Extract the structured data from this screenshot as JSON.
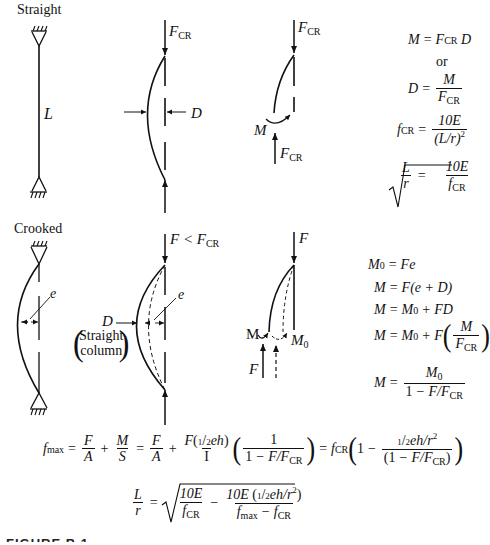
{
  "sections": {
    "straight": {
      "title": "Straight",
      "column_length_label": "L",
      "bent_column": {
        "force_top": "F",
        "force_top_sub": "CR",
        "deflection_label": "D"
      },
      "free_body": {
        "force_top": "F",
        "force_top_sub": "CR",
        "moment_label": "M",
        "force_bottom": "F",
        "force_bottom_sub": "CR"
      },
      "equations": [
        "M = F_CR D",
        "or",
        "D = M / F_CR",
        "f_CR = 10E / (L/r)^2",
        "L/r = sqrt(10E / f_CR)"
      ]
    },
    "crooked": {
      "title": "Crooked",
      "eccentricity_label": "e",
      "bent_column": {
        "force_top": "F < F",
        "force_top_sub": "CR",
        "deflection_label": "D",
        "eccentricity_label": "e",
        "note_line1": "Straight",
        "note_line2": "column"
      },
      "free_body": {
        "force_top": "F",
        "moment_label": "M",
        "initial_moment_label": "M",
        "initial_moment_sub": "0",
        "force_bottom": "F"
      },
      "equations": [
        "M_0 = Fe",
        "M = F(e + D)",
        "M = M_0 + FD",
        "M = M_0 + F(M / F_CR)",
        "M = M_0 / (1 - F/F_CR)"
      ]
    }
  },
  "bottom_equations": [
    "f_max = F/A + M/S = F/A + F(1/2 eh)/I (1/(1 - F/F_CR)) = f_CR (1 - (1/2 eh/r^2)/(1 - F/F_CR))",
    "L/r = sqrt(10E/f_CR - 10E(1/2 eh/r^2)/(f_max - f_CR))"
  ],
  "text": {
    "eq": "=",
    "plus": "+",
    "minus": "−",
    "or": "or",
    "lt": "<",
    "M": "M",
    "F": "F",
    "D": "D",
    "E10": "10E",
    "L": "L",
    "r": "r",
    "e": "e",
    "CR": "CR",
    "zero": "0",
    "one": "1",
    "two": "2",
    "max": "max",
    "f": "f",
    "A": "A",
    "S": "S",
    "I": "I",
    "eh": "eh",
    "Fe": "Fe",
    "FD": "FD",
    "Lr": "(L/r)",
    "sq": "2",
    "ehr": "eh/r",
    "slashF": "F/F",
    "e_plus_D": "(e + D)"
  },
  "caption": "FIGURE B.1"
}
